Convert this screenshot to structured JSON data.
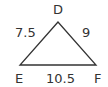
{
  "diagram": {
    "type": "triangle",
    "vertices": {
      "top": "D",
      "bottom_left": "E",
      "bottom_right": "F"
    },
    "sides": {
      "DE": "7.5",
      "DF": "9",
      "EF": "10.5"
    },
    "stroke_color": "#333333"
  }
}
